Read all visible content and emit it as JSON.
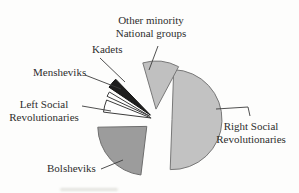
{
  "chart_data": {
    "type": "pie",
    "style": "exploded, scanned textbook illustration, no title, no legend, leader lines to labels",
    "legend": "none",
    "center": {
      "x": 155,
      "y": 119
    },
    "slices": [
      {
        "id": "right-social-revolutionaries",
        "label": "Right Social Revolutionaries",
        "value_pct": 52,
        "fill": "#c2c2c2",
        "stroke": "#787878",
        "start": -88,
        "end": 92,
        "radius": 50,
        "explode": 17
      },
      {
        "id": "bolsheviks",
        "label": "Bolsheviks",
        "value_pct": 24,
        "fill": "#9c9c9c",
        "stroke": "#6e6e6e",
        "start": 97,
        "end": 179,
        "radius": 49,
        "explode": 11
      },
      {
        "id": "left-social-revolutionaries",
        "label": "Left Social Revolutionaries",
        "value_pct": 5,
        "fill": "#fefefe",
        "stroke": "#3c3c3c",
        "start": 187,
        "end": 202,
        "radius": 48,
        "explode": 4
      },
      {
        "id": "mensheviks",
        "label": "Mensheviks",
        "value_pct": 2,
        "fill": "#fefefe",
        "stroke": "#3c3c3c",
        "start": 205,
        "end": 211,
        "radius": 47,
        "explode": 6
      },
      {
        "id": "kadets",
        "label": "Kadets",
        "value_pct": 3,
        "fill": "#1e1e1e",
        "stroke": "#141414",
        "start": 214,
        "end": 226,
        "radius": 50,
        "explode": 6
      },
      {
        "id": "other-minority-national-groups",
        "label": "Other minority National groups",
        "value_pct": 14,
        "fill": "#c0c0c0",
        "stroke": "#787878",
        "start": 254,
        "end": 298,
        "radius": 48,
        "explode": 10
      }
    ],
    "leader_lines": [
      {
        "id": "other-minority-national-groups",
        "points": [
          [
            158,
            46
          ],
          [
            149,
            70
          ]
        ]
      },
      {
        "id": "kadets",
        "points": [
          [
            100,
            58
          ],
          [
            125,
            82
          ]
        ]
      },
      {
        "id": "mensheviks",
        "points": [
          [
            85,
            75
          ],
          [
            121,
            89
          ]
        ]
      },
      {
        "id": "left-social-revolutionaries",
        "points": [
          [
            82,
            106
          ],
          [
            111,
            111
          ]
        ]
      },
      {
        "id": "bolsheviks",
        "points": [
          [
            101,
            169
          ],
          [
            123,
            160
          ]
        ]
      },
      {
        "id": "right-social-revolutionaries",
        "points": [
          [
            216,
            109
          ],
          [
            248,
            107
          ],
          [
            250,
            116
          ]
        ]
      }
    ],
    "line_color": "#3c3c3c"
  },
  "labels": {
    "other_minority": {
      "line1": "Other minority",
      "line2": "National groups"
    },
    "kadets": {
      "text": "Kadets"
    },
    "mensheviks": {
      "text": "Mensheviks"
    },
    "left_sr": {
      "line1": "Left Social",
      "line2": "Revolutionaries"
    },
    "bolsheviks": {
      "text": "Bolsheviks"
    },
    "right_sr": {
      "line1": "Right Social",
      "line2": "Revolutionaries"
    }
  }
}
